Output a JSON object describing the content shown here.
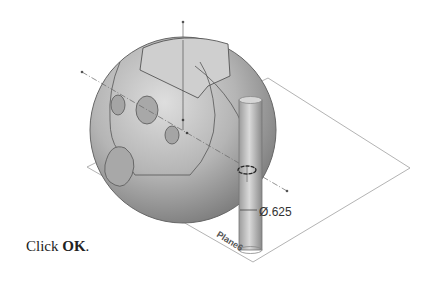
{
  "figure": {
    "dimension_label": "Ø.625",
    "plane_label": "Plane6"
  },
  "caption": {
    "prefix": "Click ",
    "bold": "OK",
    "suffix": "."
  },
  "colors": {
    "sphere": "#b8b8b8",
    "edges": "#555555",
    "plane": "#9a9a9a",
    "background": "#ffffff"
  }
}
